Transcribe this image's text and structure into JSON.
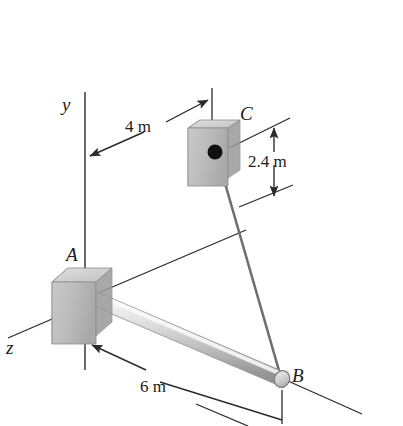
{
  "figure": {
    "background_color": "#ffffff",
    "line_color": "#2b2b2b",
    "axes": [
      {
        "name": "y-axis",
        "label": "y",
        "orientation": "vertical"
      },
      {
        "name": "z-axis",
        "label": "z",
        "orientation": "diagonal-down-left"
      }
    ],
    "points": [
      {
        "id": "A",
        "label": "A",
        "description": "bracket support at wall, origin of rod"
      },
      {
        "id": "B",
        "label": "B",
        "description": "free end of rod, cable attachment"
      },
      {
        "id": "C",
        "label": "C",
        "description": "cable anchor block on wall"
      }
    ],
    "dimensions": [
      {
        "name": "horizontal-offset-to-C",
        "label": "4 m",
        "value": 4,
        "unit": "m"
      },
      {
        "name": "vertical-drop-from-C",
        "label": "2.4 m",
        "value": 2.4,
        "unit": "m"
      },
      {
        "name": "rod-length-AB",
        "label": "6 m",
        "value": 6,
        "unit": "m"
      }
    ],
    "members": [
      {
        "name": "rod-AB",
        "type": "cylindrical-rod",
        "from": "A",
        "to": "B"
      },
      {
        "name": "cable-CB",
        "type": "cable",
        "from": "C",
        "to": "B"
      }
    ],
    "blocks": [
      {
        "name": "block-A",
        "at": "A",
        "type": "3d-box"
      },
      {
        "name": "block-C",
        "at": "C",
        "type": "3d-box"
      }
    ],
    "colors": {
      "box_front": "#b9b9b9",
      "box_top": "#d6d6d6",
      "box_side": "#9d9d9d",
      "rod_light": "#f2f2f2",
      "rod_mid": "#cfcfcf",
      "rod_dark": "#9b9b9b",
      "ink": "#2b2b2b",
      "node": "#111111"
    }
  }
}
